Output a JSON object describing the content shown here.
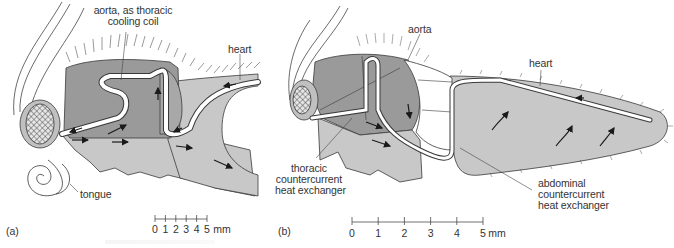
{
  "figure": {
    "colors": {
      "thorax_dark": "#9a9a9a",
      "body_light": "#c8c8c8",
      "vessel": "#ffffff",
      "outline": "#3a3a3a",
      "background": "#ffffff"
    },
    "panel_a": {
      "letter": "(a)",
      "labels": {
        "aorta_line1": "aorta, as thoracic",
        "aorta_line2": "cooling coil",
        "heart": "heart",
        "tongue": "tongue"
      },
      "scale_bar": {
        "ticks": [
          "0",
          "1",
          "2",
          "3",
          "4",
          "5"
        ],
        "unit": "mm"
      }
    },
    "panel_b": {
      "letter": "(b)",
      "labels": {
        "aorta": "aorta",
        "heart": "heart",
        "thoracic_line1": "thoracic",
        "thoracic_line2": "countercurrent",
        "thoracic_line3": "heat exchanger",
        "abdominal_line1": "abdominal",
        "abdominal_line2": "countercurrent",
        "abdominal_line3": "heat exchanger"
      },
      "scale_bar": {
        "ticks": [
          "0",
          "1",
          "2",
          "3",
          "4",
          "5"
        ],
        "unit": "mm"
      }
    }
  }
}
